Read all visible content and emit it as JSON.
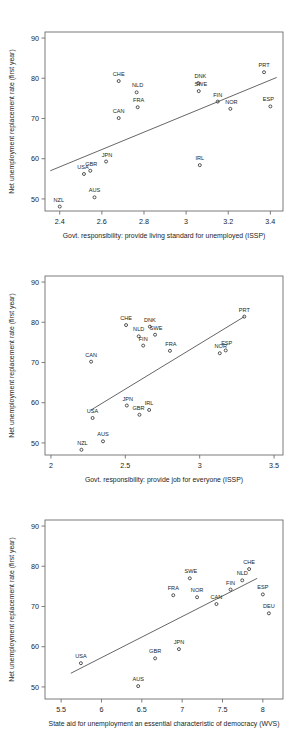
{
  "figure": {
    "background": "#ffffff",
    "marker_color": "#2b2b2b",
    "line_color": "#4a4a4a",
    "frame_color": "#6e6e6e",
    "panel_count": 3
  },
  "chart_data": [
    {
      "type": "scatter",
      "title": "",
      "xlabel": "Govt. responsibility: provide living standard for unemployed (ISSP)",
      "ylabel": "Net unemployment replacement rate (first year)",
      "xlim": [
        2.33,
        3.46
      ],
      "ylim": [
        47.0,
        91.5
      ],
      "xticks": [
        "2.4",
        "2.6",
        "2.8",
        "3",
        "3.2",
        "3.4"
      ],
      "xtickvals": [
        2.4,
        2.6,
        2.8,
        3.0,
        3.2,
        3.4
      ],
      "yticks": [
        "50",
        "60",
        "70",
        "80",
        "90"
      ],
      "ytickvals": [
        50,
        60,
        70,
        80,
        90
      ],
      "grid": false,
      "legend": "none",
      "fit_line": {
        "x0": 2.355,
        "y0": 57.0,
        "x1": 3.43,
        "y1": 80.2
      },
      "points": [
        {
          "label": "NZL",
          "x": 2.4,
          "y": 48.1,
          "lx": -1,
          "ly": -5
        },
        {
          "label": "AUS",
          "x": 2.565,
          "y": 50.4,
          "lx": 0,
          "ly": -5
        },
        {
          "label": "USA",
          "x": 2.515,
          "y": 56.2,
          "lx": -1,
          "ly": -5
        },
        {
          "label": "GBR",
          "x": 2.545,
          "y": 57.0,
          "lx": 1,
          "ly": -5
        },
        {
          "label": "JPN",
          "x": 2.62,
          "y": 59.3,
          "lx": 1,
          "ly": -5
        },
        {
          "label": "IRL",
          "x": 3.065,
          "y": 58.4,
          "lx": 0,
          "ly": -5
        },
        {
          "label": "CAN",
          "x": 2.68,
          "y": 70.1,
          "lx": 0,
          "ly": -5
        },
        {
          "label": "FRA",
          "x": 2.77,
          "y": 72.8,
          "lx": 1,
          "ly": -5
        },
        {
          "label": "NOR",
          "x": 3.21,
          "y": 72.4,
          "lx": 1,
          "ly": -5
        },
        {
          "label": "ESP",
          "x": 3.4,
          "y": 73.0,
          "lx": -2,
          "ly": -5
        },
        {
          "label": "FIN",
          "x": 3.15,
          "y": 74.2,
          "lx": 0,
          "ly": -5
        },
        {
          "label": "NLD",
          "x": 2.765,
          "y": 76.5,
          "lx": 1,
          "ly": -5
        },
        {
          "label": "SWE",
          "x": 3.06,
          "y": 76.8,
          "lx": 2,
          "ly": -5
        },
        {
          "label": "DNK",
          "x": 3.058,
          "y": 78.8,
          "lx": 2,
          "ly": -5
        },
        {
          "label": "CHE",
          "x": 2.68,
          "y": 79.3,
          "lx": 0,
          "ly": -5
        },
        {
          "label": "PRT",
          "x": 3.37,
          "y": 81.5,
          "lx": 0,
          "ly": -5
        }
      ]
    },
    {
      "type": "scatter",
      "title": "",
      "xlabel": "Govt. responsibility: provide job for everyone (ISSP)",
      "ylabel": "Net unemployment replacement rate (first year)",
      "xlim": [
        1.96,
        3.56
      ],
      "ylim": [
        47.0,
        91.5
      ],
      "xticks": [
        "2",
        "2.5",
        "3",
        "3.5"
      ],
      "xtickvals": [
        2.0,
        2.5,
        3.0,
        3.5
      ],
      "yticks": [
        "50",
        "60",
        "70",
        "80",
        "90"
      ],
      "ytickvals": [
        50,
        60,
        70,
        80,
        90
      ],
      "grid": false,
      "legend": "none",
      "fit_line": {
        "x0": 2.27,
        "y0": 58.2,
        "x1": 3.3,
        "y1": 81.4
      },
      "points": [
        {
          "label": "NZL",
          "x": 2.205,
          "y": 48.3,
          "lx": 1,
          "ly": -5
        },
        {
          "label": "AUS",
          "x": 2.35,
          "y": 50.4,
          "lx": 0,
          "ly": -5
        },
        {
          "label": "USA",
          "x": 2.28,
          "y": 56.2,
          "lx": 0,
          "ly": -5
        },
        {
          "label": "GBR",
          "x": 2.595,
          "y": 57.0,
          "lx": -1,
          "ly": -5
        },
        {
          "label": "IRL",
          "x": 2.66,
          "y": 58.2,
          "lx": 0,
          "ly": -5
        },
        {
          "label": "JPN",
          "x": 2.51,
          "y": 59.3,
          "lx": 1,
          "ly": -5
        },
        {
          "label": "CAN",
          "x": 2.27,
          "y": 70.2,
          "lx": 0,
          "ly": -5
        },
        {
          "label": "NOR",
          "x": 3.135,
          "y": 72.3,
          "lx": 1,
          "ly": -5
        },
        {
          "label": "FRA",
          "x": 2.8,
          "y": 72.9,
          "lx": 1,
          "ly": -5
        },
        {
          "label": "ESP",
          "x": 3.175,
          "y": 73.0,
          "lx": 1,
          "ly": -5
        },
        {
          "label": "FIN",
          "x": 2.62,
          "y": 74.2,
          "lx": 0,
          "ly": -5
        },
        {
          "label": "NLD",
          "x": 2.59,
          "y": 76.5,
          "lx": 0,
          "ly": -5
        },
        {
          "label": "SWE",
          "x": 2.7,
          "y": 76.9,
          "lx": 1,
          "ly": -5
        },
        {
          "label": "DNK",
          "x": 2.665,
          "y": 78.9,
          "lx": 0,
          "ly": -5
        },
        {
          "label": "CHE",
          "x": 2.505,
          "y": 79.3,
          "lx": 0,
          "ly": -5
        },
        {
          "label": "PRT",
          "x": 3.3,
          "y": 81.4,
          "lx": 0,
          "ly": -5
        }
      ]
    },
    {
      "type": "scatter",
      "title": "",
      "xlabel": "State aid for unemployment an essential characteristic of democracy (WVS)",
      "ylabel": "Net unemployment replacement rate (first year)",
      "xlim": [
        5.3,
        8.25
      ],
      "ylim": [
        47.0,
        91.5
      ],
      "xticks": [
        "5.5",
        "6",
        "6.5",
        "7",
        "7.5",
        "8"
      ],
      "xtickvals": [
        5.5,
        6.0,
        6.5,
        7.0,
        7.5,
        8.0
      ],
      "yticks": [
        "50",
        "60",
        "70",
        "80",
        "90"
      ],
      "ytickvals": [
        50,
        60,
        70,
        80,
        90
      ],
      "grid": false,
      "legend": "none",
      "fit_line": {
        "x0": 5.62,
        "y0": 53.4,
        "x1": 7.93,
        "y1": 77.0
      },
      "points": [
        {
          "label": "AUS",
          "x": 6.455,
          "y": 50.2,
          "lx": 0,
          "ly": -5
        },
        {
          "label": "USA",
          "x": 5.745,
          "y": 55.9,
          "lx": 0,
          "ly": -5
        },
        {
          "label": "GBR",
          "x": 6.665,
          "y": 57.1,
          "lx": 0,
          "ly": -5
        },
        {
          "label": "JPN",
          "x": 6.96,
          "y": 59.4,
          "lx": 0,
          "ly": -5
        },
        {
          "label": "DEU",
          "x": 8.075,
          "y": 68.3,
          "lx": 0,
          "ly": -5
        },
        {
          "label": "CAN",
          "x": 7.425,
          "y": 70.6,
          "lx": 0,
          "ly": -5
        },
        {
          "label": "NOR",
          "x": 7.185,
          "y": 72.3,
          "lx": 0,
          "ly": -5
        },
        {
          "label": "FRA",
          "x": 6.89,
          "y": 72.8,
          "lx": 0,
          "ly": -5
        },
        {
          "label": "ESP",
          "x": 8.0,
          "y": 73.0,
          "lx": 0,
          "ly": -5
        },
        {
          "label": "FIN",
          "x": 7.6,
          "y": 74.2,
          "lx": 0,
          "ly": -5
        },
        {
          "label": "NLD",
          "x": 7.745,
          "y": 76.5,
          "lx": 0,
          "ly": -5
        },
        {
          "label": "SWE",
          "x": 7.095,
          "y": 77.0,
          "lx": 1,
          "ly": -5
        },
        {
          "label": "CHE",
          "x": 7.83,
          "y": 79.3,
          "lx": 0,
          "ly": -5
        }
      ]
    }
  ]
}
